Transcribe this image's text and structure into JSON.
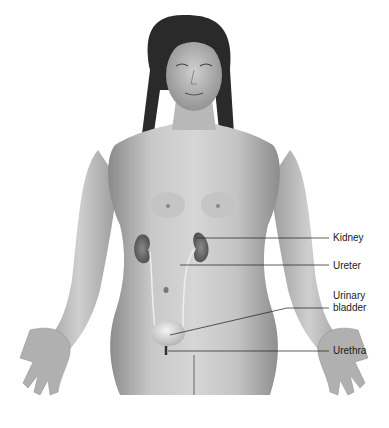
{
  "figure": {
    "labels": [
      {
        "id": "kidney",
        "text": "Kidney"
      },
      {
        "id": "ureter",
        "text": "Ureter"
      },
      {
        "id": "urinary-bladder",
        "text": "Urinary bladder",
        "line1": "Urinary",
        "line2": "bladder"
      },
      {
        "id": "urethra",
        "text": "Urethra"
      }
    ]
  }
}
